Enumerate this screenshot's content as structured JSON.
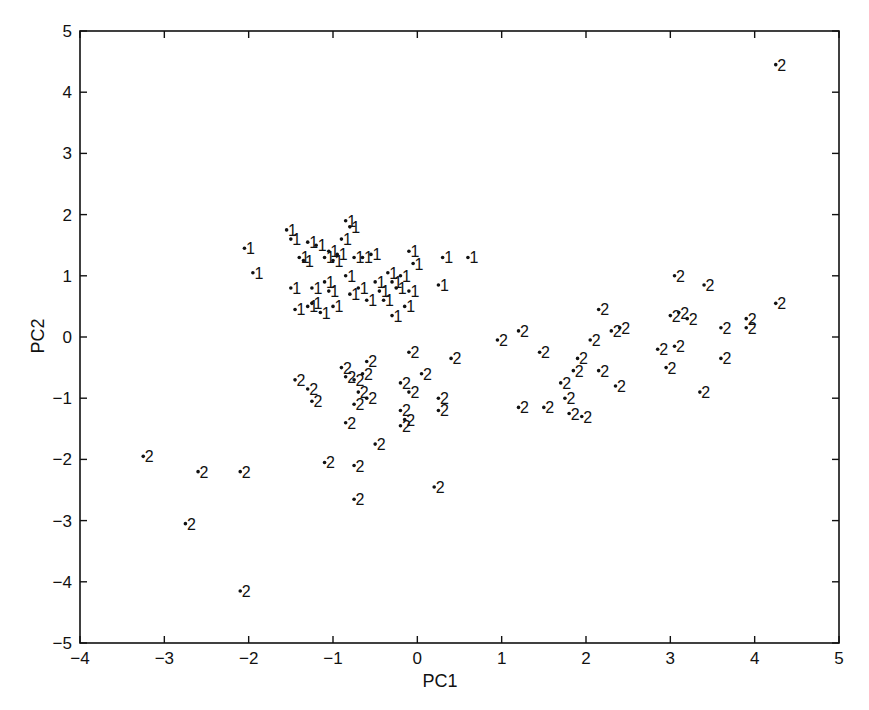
{
  "chart_data": {
    "type": "scatter",
    "title": "",
    "xlabel": "PC1",
    "ylabel": "PC2",
    "xlim": [
      -4,
      5
    ],
    "ylim": [
      -5,
      5
    ],
    "xticks": [
      -4,
      -3,
      -2,
      -1,
      0,
      1,
      2,
      3,
      4,
      5
    ],
    "yticks": [
      -5,
      -4,
      -3,
      -2,
      -1,
      0,
      1,
      2,
      3,
      4,
      5
    ],
    "grid": false,
    "legend": null,
    "marker": "dot with class-number text label",
    "series": [
      {
        "name": "1",
        "label": "1",
        "points": [
          [
            -2.05,
            1.45
          ],
          [
            -1.95,
            1.05
          ],
          [
            -1.55,
            1.75
          ],
          [
            -1.5,
            1.6
          ],
          [
            -1.4,
            1.3
          ],
          [
            -1.5,
            0.8
          ],
          [
            -1.35,
            1.25
          ],
          [
            -1.3,
            0.5
          ],
          [
            -1.25,
            0.55
          ],
          [
            -1.3,
            1.55
          ],
          [
            -1.2,
            1.5
          ],
          [
            -1.25,
            0.8
          ],
          [
            -1.1,
            1.3
          ],
          [
            -1.05,
            1.4
          ],
          [
            -1.05,
            0.75
          ],
          [
            -1.0,
            1.25
          ],
          [
            -1.0,
            0.5
          ],
          [
            -0.95,
            1.35
          ],
          [
            -0.9,
            1.6
          ],
          [
            -0.85,
            1.9
          ],
          [
            -0.85,
            1.0
          ],
          [
            -0.8,
            0.7
          ],
          [
            -0.8,
            1.8
          ],
          [
            -0.75,
            1.3
          ],
          [
            -0.7,
            0.8
          ],
          [
            -0.65,
            1.3
          ],
          [
            -0.6,
            0.6
          ],
          [
            -0.55,
            1.35
          ],
          [
            -0.5,
            0.9
          ],
          [
            -0.45,
            0.75
          ],
          [
            -0.4,
            0.6
          ],
          [
            -0.35,
            1.05
          ],
          [
            -0.3,
            0.9
          ],
          [
            -0.25,
            0.8
          ],
          [
            -0.2,
            1.0
          ],
          [
            -0.15,
            0.5
          ],
          [
            -0.1,
            1.4
          ],
          [
            -0.1,
            0.75
          ],
          [
            -0.05,
            1.2
          ],
          [
            -0.3,
            0.35
          ],
          [
            0.3,
            1.3
          ],
          [
            0.6,
            1.3
          ],
          [
            0.25,
            0.85
          ],
          [
            -1.15,
            0.4
          ],
          [
            -1.45,
            0.45
          ],
          [
            -1.1,
            0.9
          ]
        ]
      },
      {
        "name": "2",
        "label": "2",
        "points": [
          [
            4.25,
            4.45
          ],
          [
            3.05,
            1.0
          ],
          [
            3.4,
            0.85
          ],
          [
            2.15,
            0.45
          ],
          [
            4.25,
            0.55
          ],
          [
            3.0,
            0.35
          ],
          [
            3.1,
            0.4
          ],
          [
            3.2,
            0.3
          ],
          [
            3.6,
            0.15
          ],
          [
            3.9,
            0.3
          ],
          [
            3.9,
            0.15
          ],
          [
            1.2,
            0.1
          ],
          [
            2.3,
            0.1
          ],
          [
            2.4,
            0.15
          ],
          [
            0.95,
            -0.05
          ],
          [
            2.05,
            -0.05
          ],
          [
            2.85,
            -0.2
          ],
          [
            3.05,
            -0.15
          ],
          [
            1.45,
            -0.25
          ],
          [
            1.9,
            -0.35
          ],
          [
            3.6,
            -0.35
          ],
          [
            2.95,
            -0.5
          ],
          [
            1.85,
            -0.55
          ],
          [
            2.15,
            -0.55
          ],
          [
            1.7,
            -0.75
          ],
          [
            2.35,
            -0.8
          ],
          [
            3.35,
            -0.9
          ],
          [
            1.75,
            -1.0
          ],
          [
            1.2,
            -1.15
          ],
          [
            1.5,
            -1.15
          ],
          [
            1.8,
            -1.25
          ],
          [
            1.95,
            -1.3
          ],
          [
            -1.45,
            -0.7
          ],
          [
            -1.3,
            -0.85
          ],
          [
            -1.25,
            -1.05
          ],
          [
            -0.9,
            -0.5
          ],
          [
            -0.85,
            -0.65
          ],
          [
            -0.75,
            -0.7
          ],
          [
            -0.65,
            -0.6
          ],
          [
            -0.6,
            -0.4
          ],
          [
            -0.7,
            -0.9
          ],
          [
            -0.6,
            -1.0
          ],
          [
            -0.75,
            -1.1
          ],
          [
            -0.85,
            -1.4
          ],
          [
            -0.2,
            -0.75
          ],
          [
            -0.1,
            -0.25
          ],
          [
            0.05,
            -0.6
          ],
          [
            0.4,
            -0.35
          ],
          [
            -0.1,
            -0.9
          ],
          [
            -0.2,
            -1.2
          ],
          [
            -0.15,
            -1.35
          ],
          [
            -0.2,
            -1.45
          ],
          [
            0.25,
            -1.0
          ],
          [
            0.25,
            -1.2
          ],
          [
            -0.5,
            -1.75
          ],
          [
            -1.1,
            -2.05
          ],
          [
            -0.75,
            -2.1
          ],
          [
            -3.25,
            -1.95
          ],
          [
            -2.6,
            -2.2
          ],
          [
            -2.1,
            -2.2
          ],
          [
            0.2,
            -2.45
          ],
          [
            -0.75,
            -2.65
          ],
          [
            -2.75,
            -3.05
          ],
          [
            -2.1,
            -4.15
          ]
        ]
      }
    ]
  },
  "colors": {
    "background": "#ffffff",
    "ink": "#111111"
  }
}
